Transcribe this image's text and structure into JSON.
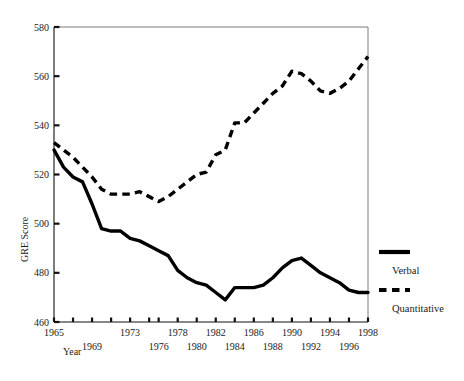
{
  "chart_data": {
    "type": "line",
    "title": "",
    "xlabel": "Year",
    "ylabel": "GRE Score",
    "xlim": [
      1965,
      1998
    ],
    "ylim": [
      460,
      580
    ],
    "grid": false,
    "legend_position": "right",
    "y_ticks": [
      460,
      480,
      500,
      520,
      540,
      560,
      580
    ],
    "x_ticks": [
      1965,
      1967,
      1969,
      1971,
      1973,
      1975,
      1976,
      1978,
      1980,
      1982,
      1984,
      1986,
      1988,
      1990,
      1992,
      1994,
      1996,
      1998
    ],
    "x_tick_labels_upper": [
      "1965",
      "1973",
      "1978",
      "1982",
      "1986",
      "1990",
      "1994",
      "1998"
    ],
    "x_tick_labels_lower": [
      "1969",
      "1976",
      "1980",
      "1984",
      "1988",
      "1992",
      "1996"
    ],
    "x": [
      1965,
      1966,
      1967,
      1968,
      1969,
      1970,
      1971,
      1972,
      1973,
      1974,
      1975,
      1976,
      1977,
      1978,
      1979,
      1980,
      1981,
      1982,
      1983,
      1984,
      1985,
      1986,
      1987,
      1988,
      1989,
      1990,
      1991,
      1992,
      1993,
      1994,
      1995,
      1996,
      1997,
      1998
    ],
    "series": [
      {
        "name": "Verbal",
        "style": "solid",
        "color": "#000000",
        "values": [
          530,
          523,
          519,
          517,
          508,
          498,
          497,
          497,
          494,
          493,
          491,
          489,
          487,
          481,
          478,
          476,
          475,
          472,
          469,
          474,
          474,
          474,
          475,
          478,
          482,
          485,
          486,
          483,
          480,
          478,
          476,
          473,
          472,
          472
        ]
      },
      {
        "name": "Quantitative",
        "style": "dashed",
        "color": "#000000",
        "values": [
          533,
          530,
          527,
          523,
          519,
          514,
          512,
          512,
          512,
          513,
          511,
          509,
          511,
          514,
          517,
          520,
          521,
          528,
          530,
          541,
          541,
          545,
          549,
          553,
          556,
          562,
          561,
          558,
          554,
          553,
          555,
          558,
          563,
          568
        ]
      }
    ]
  },
  "legend": {
    "items": [
      {
        "label": "Verbal",
        "style": "solid"
      },
      {
        "label": "Quantitative",
        "style": "dashed"
      }
    ]
  }
}
